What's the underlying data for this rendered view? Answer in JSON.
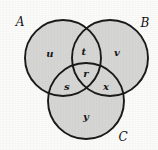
{
  "figure": {
    "type": "venn-diagram-3-set",
    "background_color": "#fbfbfa",
    "fill_color": "#d6d6d4",
    "stroke_color": "#1a1a1a"
  },
  "sets": [
    {
      "key": "A",
      "label": "A",
      "label_x": 20,
      "label_y": 22,
      "cx": 63,
      "cy": 58,
      "r": 38
    },
    {
      "key": "B",
      "label": "B",
      "label_x": 145,
      "label_y": 23,
      "cx": 110,
      "cy": 58,
      "r": 38
    },
    {
      "key": "C",
      "label": "C",
      "label_x": 123,
      "label_y": 137,
      "cx": 86,
      "cy": 101,
      "r": 38
    }
  ],
  "regions": [
    {
      "key": "u",
      "label": "u",
      "x": 50,
      "y": 54,
      "meaning": "A only"
    },
    {
      "key": "t",
      "label": "t",
      "x": 84,
      "y": 52,
      "meaning": "A and B only"
    },
    {
      "key": "v",
      "label": "v",
      "x": 117,
      "y": 53,
      "meaning": "B only"
    },
    {
      "key": "r",
      "label": "r",
      "x": 86,
      "y": 74,
      "meaning": "A and B and C"
    },
    {
      "key": "s",
      "label": "s",
      "x": 67,
      "y": 87,
      "meaning": "A and C only"
    },
    {
      "key": "x",
      "label": "x",
      "x": 106,
      "y": 87,
      "meaning": "B and C only"
    },
    {
      "key": "y",
      "label": "y",
      "x": 86,
      "y": 117,
      "meaning": "C only"
    }
  ]
}
